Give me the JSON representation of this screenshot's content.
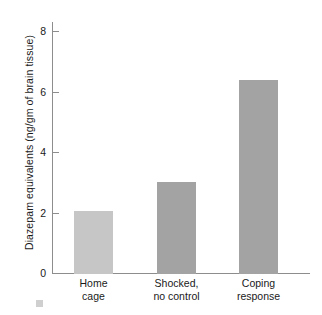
{
  "chart_data": {
    "type": "bar",
    "title": "",
    "subtitle": "",
    "xlabel": "",
    "ylabel": "Diazepam equivalents (ng/gm of brain tissue)",
    "categories": [
      "Home\ncage",
      "Shocked,\nno control",
      "Coping\nresponse"
    ],
    "category_labels_flat": [
      "Home cage",
      "Shocked, no control",
      "Coping response"
    ],
    "values": [
      2.1,
      3.05,
      6.4
    ],
    "ylim": [
      0,
      8.3
    ],
    "yticks": [
      0,
      2,
      4,
      6,
      8
    ],
    "ytick_labels": [
      "0",
      "2",
      "4",
      "6",
      "8"
    ],
    "grid": false,
    "legend": null,
    "bar_colors": [
      "#c6c6c6",
      "#a3a3a3",
      "#a3a3a3"
    ],
    "axis_color": "#8d8d8d",
    "text_color": "#1a1a1a",
    "background": "#ffffff"
  }
}
